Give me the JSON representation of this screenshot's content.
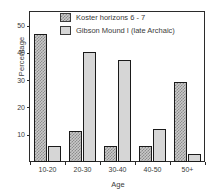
{
  "chart_data": {
    "type": "bar",
    "title": "",
    "xlabel": "Age",
    "ylabel": "Percentage",
    "categories": [
      "10-20",
      "20-30",
      "30-40",
      "40-50",
      "50+"
    ],
    "series": [
      {
        "name": "Koster horizons 6 - 7",
        "values": [
          47,
          11.5,
          6,
          6,
          29.5
        ],
        "fill": "checkered-gray",
        "color": "#c9c9c9"
      },
      {
        "name": "Gibson Mound I (late Archaic)",
        "values": [
          6,
          40.5,
          37.5,
          12,
          3
        ],
        "fill": "solid-light-gray",
        "color": "#d6d6d6"
      }
    ],
    "ylim": [
      0,
      55
    ],
    "yticks": [
      10,
      20,
      30,
      40,
      50
    ],
    "ytick_labels": [
      "10",
      "20",
      "30",
      "40",
      "50"
    ],
    "grid": false,
    "legend_position": "top-center",
    "axis_color": "#2b2b2b",
    "text_color": "#3a3a3a",
    "background": "#ffffff"
  },
  "legend": {
    "entries": [
      {
        "label": "Koster horizons 6 - 7"
      },
      {
        "label": "Gibson Mound I (late Archaic)"
      }
    ]
  }
}
